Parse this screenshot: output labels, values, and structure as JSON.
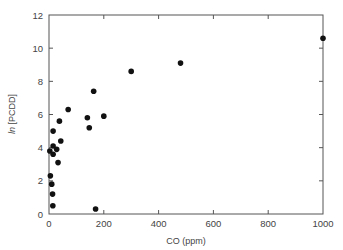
{
  "chart_data": {
    "type": "scatter",
    "title": "",
    "xlabel": "CO (ppm)",
    "ylabel_prefix": "ln",
    "ylabel_rest": " [PCDD]",
    "ylabel": "ln [PCDD]",
    "xlim": [
      0,
      1000
    ],
    "ylim": [
      0,
      12
    ],
    "xticks": [
      0,
      200,
      400,
      600,
      800,
      1000
    ],
    "yticks": [
      0,
      2,
      4,
      6,
      8,
      10,
      12
    ],
    "grid": false,
    "legend": null,
    "marker_color": "#111111",
    "points": [
      {
        "x": 3,
        "y": 3.8
      },
      {
        "x": 5,
        "y": 2.3
      },
      {
        "x": 10,
        "y": 1.8
      },
      {
        "x": 13,
        "y": 1.2
      },
      {
        "x": 14,
        "y": 0.5
      },
      {
        "x": 15,
        "y": 5.0
      },
      {
        "x": 15,
        "y": 4.1
      },
      {
        "x": 15,
        "y": 3.6
      },
      {
        "x": 28,
        "y": 3.9
      },
      {
        "x": 33,
        "y": 3.1
      },
      {
        "x": 38,
        "y": 5.6
      },
      {
        "x": 43,
        "y": 4.4
      },
      {
        "x": 70,
        "y": 6.3
      },
      {
        "x": 140,
        "y": 5.8
      },
      {
        "x": 147,
        "y": 5.2
      },
      {
        "x": 163,
        "y": 7.4
      },
      {
        "x": 170,
        "y": 0.3
      },
      {
        "x": 200,
        "y": 5.9
      },
      {
        "x": 300,
        "y": 8.6
      },
      {
        "x": 480,
        "y": 9.1
      },
      {
        "x": 1000,
        "y": 10.6
      }
    ]
  }
}
